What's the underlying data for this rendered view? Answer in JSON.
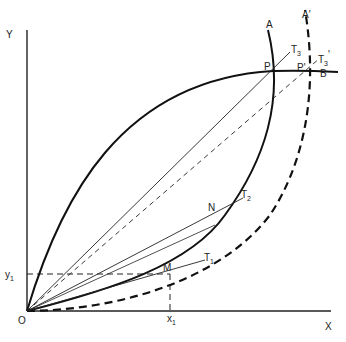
{
  "diagram": {
    "axes": {
      "x_label": "X",
      "y_label": "Y",
      "origin_label": "O"
    },
    "guides": {
      "x1_label": "x",
      "x1_sub": "1",
      "y1_label": "y",
      "y1_sub": "1"
    },
    "curves": {
      "A_label": "A",
      "A_prime_label": "A'",
      "B_label": "B"
    },
    "points": {
      "P": "P",
      "P_prime": "P'",
      "M": "M",
      "N": "N"
    },
    "tangents": {
      "T1": "T",
      "T1_sub": "1",
      "T2": "T",
      "T2_sub": "2",
      "T3": "T",
      "T3_sub": "3",
      "T3_prime": "T",
      "T3_prime_sub": "3",
      "T3_prime_mark": "'"
    },
    "colors": {
      "line": "#1a1a1a"
    }
  }
}
